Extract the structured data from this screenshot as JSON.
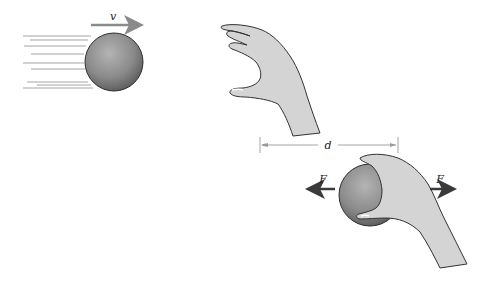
{
  "diagram": {
    "labels": {
      "velocity": "v",
      "distance": "d",
      "force_left": "F",
      "force_right": "F"
    },
    "colors": {
      "ball_light": "#b0b0b0",
      "ball_dark": "#5a5a5a",
      "hand_fill": "#d4d4d4",
      "outline": "#333333",
      "arrow_gray": "#8a8a8a",
      "arrow_dark": "#3a3a3a",
      "speed_lines": "#9a9a9a",
      "dimension_line": "#9a9a9a"
    }
  }
}
